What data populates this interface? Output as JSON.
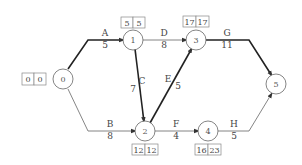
{
  "diagram": {
    "type": "activity-on-arrow network",
    "nodes": [
      {
        "id": "0",
        "label": "0",
        "x": 63,
        "y": 79,
        "times": [
          "0",
          "0"
        ],
        "box_pos": "left"
      },
      {
        "id": "1",
        "label": "1",
        "x": 133,
        "y": 40,
        "times": [
          "5",
          "5"
        ],
        "box_pos": "top"
      },
      {
        "id": "3",
        "label": "3",
        "x": 196,
        "y": 40,
        "times": [
          "17",
          "17"
        ],
        "box_pos": "top"
      },
      {
        "id": "2",
        "label": "2",
        "x": 145,
        "y": 131,
        "times": [
          "12",
          "12"
        ],
        "box_pos": "bottom"
      },
      {
        "id": "4",
        "label": "4",
        "x": 208,
        "y": 131,
        "times": [
          "16",
          "23"
        ],
        "box_pos": "bottom"
      },
      {
        "id": "5",
        "label": "5",
        "x": 276,
        "y": 84,
        "times": [],
        "box_pos": "none"
      }
    ],
    "activities": [
      {
        "name": "A",
        "duration": "5",
        "from": "0",
        "to": "1",
        "critical": true
      },
      {
        "name": "B",
        "duration": "8",
        "from": "0",
        "to": "2",
        "critical": false
      },
      {
        "name": "C",
        "duration": "7",
        "from": "1",
        "to": "2",
        "critical": true
      },
      {
        "name": "D",
        "duration": "8",
        "from": "1",
        "to": "3",
        "critical": false
      },
      {
        "name": "E",
        "duration": "5",
        "from": "2",
        "to": "3",
        "critical": true
      },
      {
        "name": "F",
        "duration": "4",
        "from": "2",
        "to": "4",
        "critical": false
      },
      {
        "name": "G",
        "duration": "11",
        "from": "3",
        "to": "5",
        "critical": true
      },
      {
        "name": "H",
        "duration": "5",
        "from": "4",
        "to": "5",
        "critical": false
      }
    ]
  }
}
